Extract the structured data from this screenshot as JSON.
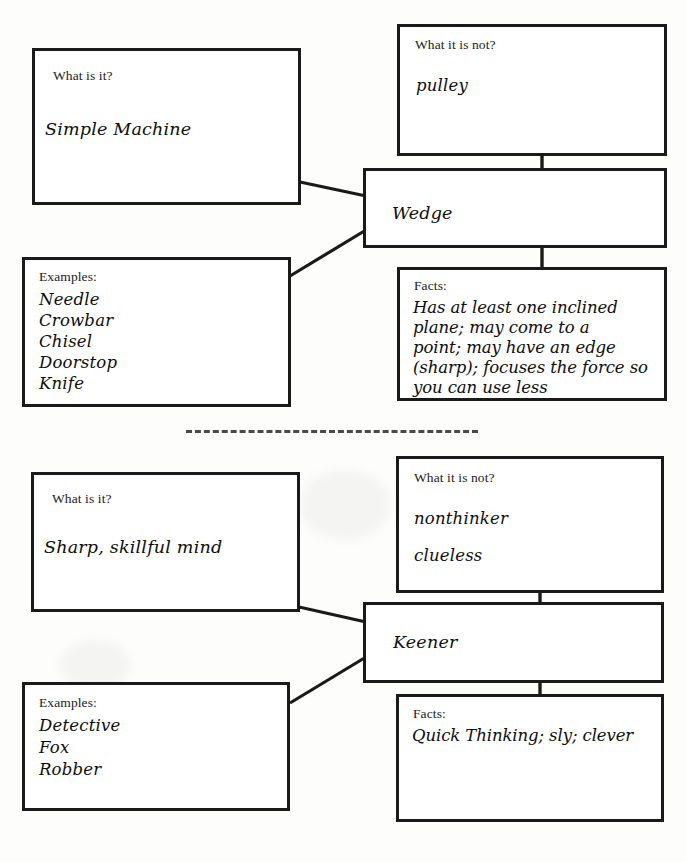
{
  "page": {
    "width": 687,
    "height": 862,
    "background": "#fdfdfc",
    "ink_color": "#1a1a1a",
    "divider_color": "#4a4a4a"
  },
  "diagrams": [
    {
      "id": "wedge-map",
      "center": {
        "label": "Wedge"
      },
      "what_is_it": {
        "prompt": "What is it?",
        "answer": "Simple Machine"
      },
      "what_it_is_not": {
        "prompt": "What it is not?",
        "answers": [
          "pulley"
        ]
      },
      "examples": {
        "prompt": "Examples:",
        "items": [
          "Needle",
          "Crowbar",
          "Chisel",
          "Doorstop",
          "Knife"
        ]
      },
      "facts": {
        "prompt": "Facts:",
        "lines": [
          "Has at least one inclined",
          "plane; may come to a",
          "point; may have an edge",
          "(sharp); focuses the force so",
          "you can use less"
        ]
      }
    },
    {
      "id": "keener-map",
      "center": {
        "label": "Keener"
      },
      "what_is_it": {
        "prompt": "What is it?",
        "answer": "Sharp, skillful mind"
      },
      "what_it_is_not": {
        "prompt": "What it is not?",
        "answers": [
          "nonthinker",
          "clueless"
        ]
      },
      "examples": {
        "prompt": "Examples:",
        "items": [
          "Detective",
          "Fox",
          "Robber"
        ]
      },
      "facts": {
        "prompt": "Facts:",
        "lines": [
          "Quick Thinking; sly; clever"
        ]
      }
    }
  ],
  "divider": {
    "name": "dashed-separator"
  }
}
